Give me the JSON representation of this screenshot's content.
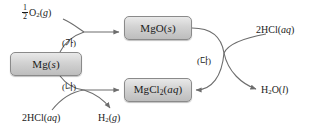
{
  "diagram": {
    "type": "reaction-flow-diagram",
    "title": "",
    "nodes": [
      {
        "id": "mg",
        "label": "Mg(s)",
        "formula": "Mg",
        "state": "s",
        "x": 10,
        "y": 52,
        "w": 72,
        "h": 24
      },
      {
        "id": "mgo",
        "label": "MgO(s)",
        "formula": "MgO",
        "state": "s",
        "x": 124,
        "y": 16,
        "w": 68,
        "h": 24
      },
      {
        "id": "mgcl2",
        "label": "MgCl2(aq)",
        "formula": "MgCl2",
        "state": "aq",
        "x": 124,
        "y": 78,
        "w": 68,
        "h": 24
      }
    ],
    "reagent_labels": [
      {
        "id": "o2-in",
        "text": "1/2 O2(g)",
        "x": 22,
        "y": 6
      },
      {
        "id": "hcl-in",
        "text": "2HCl(aq)",
        "x": 24,
        "y": 113
      },
      {
        "id": "h2-out",
        "text": "H2(g)",
        "x": 96,
        "y": 113
      },
      {
        "id": "hcl-in-2",
        "text": "2HCl(aq)",
        "x": 257,
        "y": 26
      },
      {
        "id": "h2o-out",
        "text": "H2O(l)",
        "x": 262,
        "y": 86
      }
    ],
    "step_labels": [
      {
        "id": "step-ga",
        "text": "(가)",
        "x": 64,
        "y": 37
      },
      {
        "id": "step-na",
        "text": "(나)",
        "x": 64,
        "y": 82
      },
      {
        "id": "step-da",
        "text": "(다)",
        "x": 199,
        "y": 55
      }
    ],
    "colors": {
      "node_fill_top": "#e9e9e9",
      "node_fill_bottom": "#bdbdbd",
      "node_border": "#8a8a8a",
      "arrow": "#6d6d6d",
      "text": "#1a1a1a",
      "background": "#ffffff"
    }
  }
}
